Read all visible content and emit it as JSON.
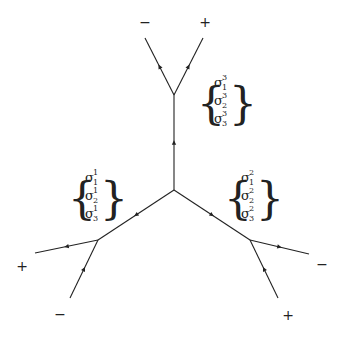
{
  "diagram": {
    "type": "tree-graph with oriented edges",
    "line_color": "#222222",
    "background": "#ffffff",
    "vertices": {
      "center": [
        174,
        190
      ],
      "top": [
        174,
        95
      ],
      "lower_left": [
        98,
        240
      ],
      "lower_right": [
        250,
        240
      ]
    },
    "edges": [
      {
        "from": [
          174,
          190
        ],
        "to": [
          174,
          95
        ],
        "arrow": "up"
      },
      {
        "from": [
          174,
          95
        ],
        "to": [
          145,
          38
        ],
        "arrow": "outward"
      },
      {
        "from": [
          174,
          95
        ],
        "to": [
          203,
          38
        ],
        "arrow": "outward"
      },
      {
        "from": [
          174,
          190
        ],
        "to": [
          98,
          240
        ],
        "arrow": "inward"
      },
      {
        "from": [
          98,
          240
        ],
        "to": [
          35,
          253
        ],
        "arrow": "outward"
      },
      {
        "from": [
          70,
          298
        ],
        "to": [
          98,
          240
        ],
        "arrow": "inward"
      },
      {
        "from": [
          174,
          190
        ],
        "to": [
          250,
          240
        ],
        "arrow": "outward"
      },
      {
        "from": [
          250,
          240
        ],
        "to": [
          309,
          254
        ],
        "arrow": "outward"
      },
      {
        "from": [
          278,
          298
        ],
        "to": [
          250,
          240
        ],
        "arrow": "inward"
      }
    ],
    "signs": [
      {
        "label": "−",
        "x": 145,
        "y": 27
      },
      {
        "label": "+",
        "x": 205,
        "y": 27
      },
      {
        "label": "+",
        "x": 22,
        "y": 271
      },
      {
        "label": "−",
        "x": 60,
        "y": 319
      },
      {
        "label": "−",
        "x": 322,
        "y": 269
      },
      {
        "label": "+",
        "x": 288,
        "y": 320
      }
    ],
    "brackets": [
      {
        "name": "left",
        "entries": [
          {
            "base": "σ",
            "sub": "1",
            "sup": "1"
          },
          {
            "base": "σ",
            "sub": "2",
            "sup": "1"
          },
          {
            "base": "σ",
            "sub": "3",
            "sup": "1"
          }
        ]
      },
      {
        "name": "right",
        "entries": [
          {
            "base": "σ",
            "sub": "1",
            "sup": "2"
          },
          {
            "base": "σ",
            "sub": "2",
            "sup": "2"
          },
          {
            "base": "σ",
            "sub": "3",
            "sup": "2"
          }
        ]
      },
      {
        "name": "top",
        "entries": [
          {
            "base": "σ",
            "sub": "1",
            "sup": "3"
          },
          {
            "base": "σ",
            "sub": "2",
            "sup": "3"
          },
          {
            "base": "σ",
            "sub": "3",
            "sup": "3"
          }
        ]
      }
    ],
    "brace_open": "{",
    "brace_close": "}"
  }
}
